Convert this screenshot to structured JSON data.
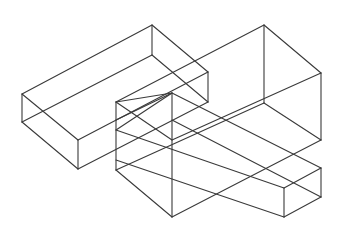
{
  "figure": {
    "title": "",
    "stroke_color": "#3a3a3a",
    "background": "#ffffff",
    "width": 337,
    "height": 234
  },
  "shapes": [
    {
      "name": "long-bar-left",
      "lines": [
        [
          22,
          94,
          152,
          25
        ],
        [
          152,
          25,
          208,
          72
        ],
        [
          22,
          94,
          78,
          140
        ],
        [
          78,
          140,
          208,
          72
        ],
        [
          22,
          94,
          22,
          122
        ],
        [
          78,
          140,
          78,
          169
        ],
        [
          152,
          25,
          152,
          55
        ],
        [
          22,
          122,
          78,
          169
        ],
        [
          22,
          122,
          152,
          55
        ],
        [
          78,
          169,
          208,
          102
        ],
        [
          152,
          55,
          208,
          102
        ],
        [
          208,
          72,
          208,
          102
        ]
      ]
    },
    {
      "name": "tall-block-right",
      "lines": [
        [
          116,
          102,
          264,
          25
        ],
        [
          264,
          25,
          321,
          73
        ],
        [
          116,
          102,
          172,
          140
        ],
        [
          172,
          140,
          321,
          73
        ],
        [
          264,
          25,
          264,
          103
        ],
        [
          321,
          73,
          321,
          140
        ],
        [
          116,
          170,
          264,
          103
        ],
        [
          172,
          217,
          321,
          140
        ],
        [
          264,
          103,
          321,
          140
        ]
      ]
    },
    {
      "name": "inner-block",
      "lines": [
        [
          116,
          102,
          116,
          170
        ],
        [
          116,
          170,
          172,
          217
        ],
        [
          172,
          93,
          172,
          217
        ],
        [
          116,
          102,
          172,
          93
        ],
        [
          172,
          93,
          116,
          120
        ]
      ]
    },
    {
      "name": "cross-bar",
      "lines": [
        [
          116,
          130,
          172,
          93
        ],
        [
          172,
          93,
          321,
          168
        ],
        [
          116,
          130,
          284,
          188
        ],
        [
          284,
          188,
          321,
          168
        ],
        [
          284,
          188,
          284,
          217
        ],
        [
          321,
          168,
          321,
          197
        ],
        [
          284,
          217,
          321,
          197
        ],
        [
          116,
          160,
          284,
          217
        ],
        [
          172,
          120,
          321,
          197
        ]
      ]
    }
  ]
}
